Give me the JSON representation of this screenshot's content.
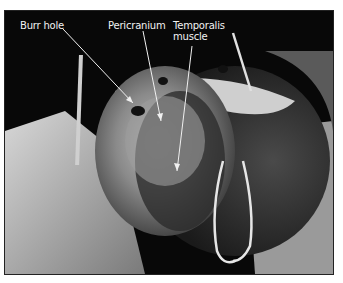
{
  "figure": {
    "labels": [
      {
        "id": "burr-hole",
        "text": "Burr hole"
      },
      {
        "id": "pericranium",
        "text": "Pericranium"
      },
      {
        "id": "temporalis-line1",
        "text": "Temporalis"
      },
      {
        "id": "temporalis-line2",
        "text": "muscle"
      }
    ]
  }
}
